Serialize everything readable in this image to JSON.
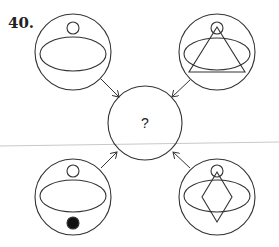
{
  "question": {
    "number": "40.",
    "center_label": "?"
  },
  "figures": [
    {
      "position": "top-left",
      "contents": [
        "small circle",
        "ellipse"
      ]
    },
    {
      "position": "top-right",
      "contents": [
        "small circle",
        "ellipse",
        "triangle"
      ]
    },
    {
      "position": "bottom-left",
      "contents": [
        "small circle",
        "ellipse",
        "filled dot"
      ]
    },
    {
      "position": "bottom-right",
      "contents": [
        "small circle",
        "ellipse",
        "diamond"
      ]
    },
    {
      "position": "center",
      "contents": [
        "question mark"
      ]
    }
  ],
  "colors": {
    "stroke": "#333333",
    "fill": "#111111",
    "rule": "#c8c8c8"
  }
}
